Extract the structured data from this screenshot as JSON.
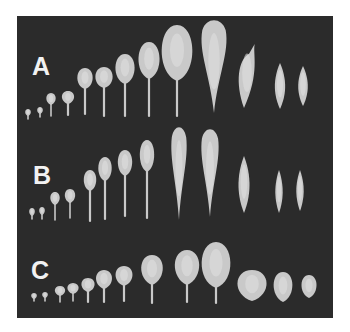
{
  "figure": {
    "background": "#2b2b2b",
    "leaf_color": "#c9c9c9",
    "leaf_highlight": "#e0e0e0",
    "rows": [
      {
        "label": "A",
        "label_pos": [
          15,
          38
        ],
        "leaves": [
          {
            "x": 11,
            "top": 93,
            "blade": 7,
            "w": 6,
            "stem": 3,
            "shape": "round"
          },
          {
            "x": 23,
            "top": 91,
            "blade": 7,
            "w": 6,
            "stem": 3,
            "shape": "round"
          },
          {
            "x": 34,
            "top": 77,
            "blade": 12,
            "w": 10,
            "stem": 11,
            "shape": "round"
          },
          {
            "x": 51,
            "top": 75,
            "blade": 13,
            "w": 13,
            "stem": 11,
            "shape": "round"
          },
          {
            "x": 68,
            "top": 52,
            "blade": 21,
            "w": 16,
            "stem": 25,
            "shape": "oval"
          },
          {
            "x": 87,
            "top": 51,
            "blade": 21,
            "w": 18,
            "stem": 28,
            "shape": "oval"
          },
          {
            "x": 108,
            "top": 38,
            "blade": 30,
            "w": 20,
            "stem": 32,
            "shape": "oval"
          },
          {
            "x": 132,
            "top": 26,
            "blade": 37,
            "w": 22,
            "stem": 37,
            "shape": "oval"
          },
          {
            "x": 160,
            "top": 9,
            "blade": 56,
            "w": 32,
            "stem": 35,
            "shape": "oval"
          },
          {
            "x": 197,
            "top": 3,
            "blade": 94,
            "w": 26,
            "stem": 0,
            "shape": "spatulate"
          },
          {
            "x": 230,
            "top": 28,
            "blade": 64,
            "w": 22,
            "stem": 0,
            "shape": "pointed"
          },
          {
            "x": 263,
            "top": 47,
            "blade": 46,
            "w": 14,
            "stem": 0,
            "shape": "diamond"
          },
          {
            "x": 286,
            "top": 50,
            "blade": 40,
            "w": 13,
            "stem": 0,
            "shape": "diamond"
          }
        ]
      },
      {
        "label": "B",
        "label_pos": [
          16,
          147
        ],
        "leaves": [
          {
            "x": 15,
            "top": 192,
            "blade": 8,
            "w": 6,
            "stem": 3,
            "shape": "round"
          },
          {
            "x": 25,
            "top": 191,
            "blade": 8,
            "w": 6,
            "stem": 4,
            "shape": "round"
          },
          {
            "x": 38,
            "top": 176,
            "blade": 13,
            "w": 10,
            "stem": 15,
            "shape": "round"
          },
          {
            "x": 53,
            "top": 173,
            "blade": 14,
            "w": 11,
            "stem": 15,
            "shape": "round"
          },
          {
            "x": 73,
            "top": 154,
            "blade": 21,
            "w": 13,
            "stem": 30,
            "shape": "oval"
          },
          {
            "x": 88,
            "top": 141,
            "blade": 24,
            "w": 14,
            "stem": 38,
            "shape": "oval"
          },
          {
            "x": 108,
            "top": 134,
            "blade": 26,
            "w": 15,
            "stem": 40,
            "shape": "oval"
          },
          {
            "x": 130,
            "top": 124,
            "blade": 32,
            "w": 15,
            "stem": 46,
            "shape": "oval"
          },
          {
            "x": 162,
            "top": 110,
            "blade": 94,
            "w": 16,
            "stem": 0,
            "shape": "spatulate"
          },
          {
            "x": 193,
            "top": 112,
            "blade": 89,
            "w": 18,
            "stem": 0,
            "shape": "spatulate"
          },
          {
            "x": 227,
            "top": 140,
            "blade": 57,
            "w": 15,
            "stem": 0,
            "shape": "diamond"
          },
          {
            "x": 262,
            "top": 154,
            "blade": 43,
            "w": 10,
            "stem": 0,
            "shape": "diamond"
          },
          {
            "x": 283,
            "top": 154,
            "blade": 41,
            "w": 10,
            "stem": 0,
            "shape": "diamond"
          }
        ]
      },
      {
        "label": "C",
        "label_pos": [
          14,
          242
        ],
        "leaves": [
          {
            "x": 17,
            "top": 277,
            "blade": 6,
            "w": 6,
            "stem": 2,
            "shape": "round"
          },
          {
            "x": 28,
            "top": 276,
            "blade": 6,
            "w": 6,
            "stem": 3,
            "shape": "round"
          },
          {
            "x": 43,
            "top": 270,
            "blade": 10,
            "w": 11,
            "stem": 6,
            "shape": "round"
          },
          {
            "x": 56,
            "top": 267,
            "blade": 11,
            "w": 12,
            "stem": 7,
            "shape": "round"
          },
          {
            "x": 71,
            "top": 262,
            "blade": 14,
            "w": 14,
            "stem": 10,
            "shape": "round"
          },
          {
            "x": 87,
            "top": 254,
            "blade": 19,
            "w": 17,
            "stem": 13,
            "shape": "round"
          },
          {
            "x": 107,
            "top": 250,
            "blade": 20,
            "w": 18,
            "stem": 15,
            "shape": "round"
          },
          {
            "x": 135,
            "top": 239,
            "blade": 30,
            "w": 23,
            "stem": 18,
            "shape": "round"
          },
          {
            "x": 170,
            "top": 234,
            "blade": 35,
            "w": 26,
            "stem": 17,
            "shape": "round"
          },
          {
            "x": 199,
            "top": 226,
            "blade": 46,
            "w": 30,
            "stem": 15,
            "shape": "oval"
          },
          {
            "x": 235,
            "top": 254,
            "blade": 31,
            "w": 31,
            "stem": 0,
            "shape": "round"
          },
          {
            "x": 266,
            "top": 256,
            "blade": 30,
            "w": 20,
            "stem": 0,
            "shape": "round"
          },
          {
            "x": 292,
            "top": 259,
            "blade": 23,
            "w": 16,
            "stem": 0,
            "shape": "round"
          }
        ]
      }
    ]
  }
}
